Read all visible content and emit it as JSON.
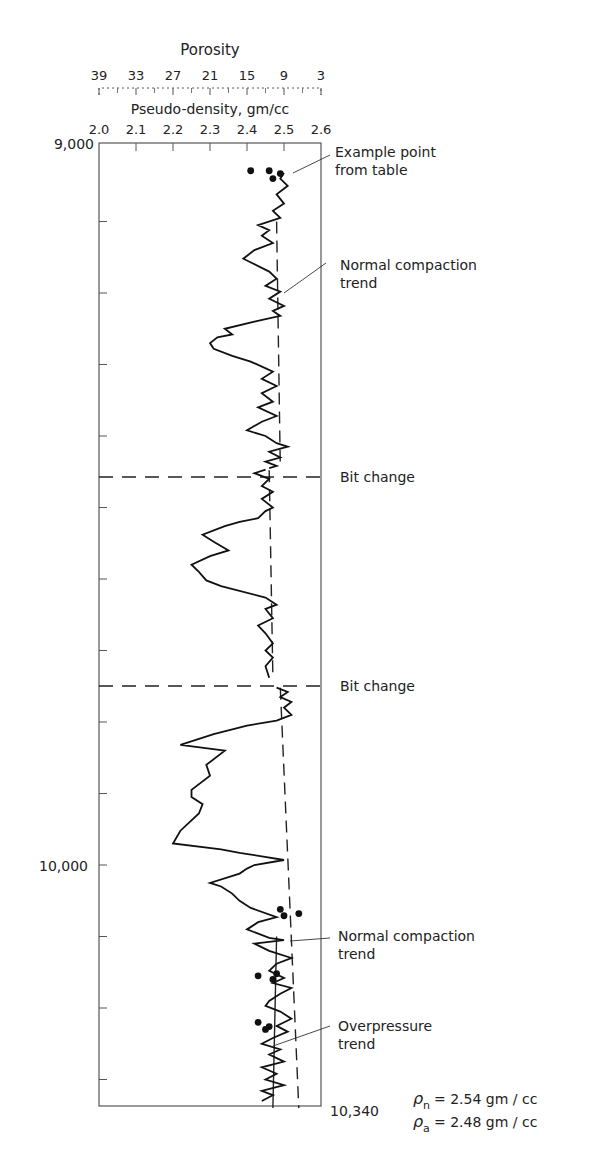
{
  "chart_data": {
    "type": "line",
    "title": "",
    "top_axis_porosity": {
      "label": "Porosity",
      "ticks": [
        "39",
        "33",
        "27",
        "21",
        "15",
        "9",
        "3"
      ]
    },
    "xlabel": "Pseudo-density, gm/cc",
    "x_ticks": [
      "2.0",
      "2.1",
      "2.2",
      "2.3",
      "2.4",
      "2.5",
      "2.6"
    ],
    "xlim": [
      2.0,
      2.6
    ],
    "ylabel": "Depth, ft",
    "y_tick_labels": [
      {
        "depth": 9000,
        "label": "9,000"
      },
      {
        "depth": 10000,
        "label": "10,000"
      },
      {
        "depth": 10340,
        "label": "10,340"
      }
    ],
    "ylim": [
      9000,
      10340
    ],
    "bit_changes_depth": [
      9445,
      9740
    ],
    "series": [
      {
        "name": "Pseudo-density log",
        "points": [
          [
            2.5,
            9032
          ],
          [
            2.49,
            9040
          ],
          [
            2.51,
            9050
          ],
          [
            2.48,
            9062
          ],
          [
            2.5,
            9075
          ],
          [
            2.47,
            9085
          ],
          [
            2.49,
            9095
          ],
          [
            2.43,
            9105
          ],
          [
            2.46,
            9112
          ],
          [
            2.44,
            9120
          ],
          [
            2.47,
            9130
          ],
          [
            2.42,
            9140
          ],
          [
            2.39,
            9152
          ],
          [
            2.46,
            9170
          ],
          [
            2.48,
            9180
          ],
          [
            2.45,
            9190
          ],
          [
            2.49,
            9198
          ],
          [
            2.46,
            9208
          ],
          [
            2.5,
            9218
          ],
          [
            2.47,
            9225
          ],
          [
            2.49,
            9232
          ],
          [
            2.42,
            9240
          ],
          [
            2.34,
            9250
          ],
          [
            2.36,
            9258
          ],
          [
            2.32,
            9262
          ],
          [
            2.3,
            9270
          ],
          [
            2.31,
            9278
          ],
          [
            2.36,
            9288
          ],
          [
            2.41,
            9296
          ],
          [
            2.47,
            9310
          ],
          [
            2.44,
            9320
          ],
          [
            2.48,
            9330
          ],
          [
            2.44,
            9340
          ],
          [
            2.47,
            9352
          ],
          [
            2.43,
            9360
          ],
          [
            2.48,
            9372
          ],
          [
            2.44,
            9380
          ],
          [
            2.4,
            9392
          ],
          [
            2.45,
            9400
          ],
          [
            2.48,
            9410
          ],
          [
            2.51,
            9415
          ],
          [
            2.46,
            9422
          ],
          [
            2.49,
            9430
          ],
          [
            2.45,
            9436
          ],
          [
            2.48,
            9442
          ],
          [
            2.46,
            9445
          ]
        ]
      },
      {
        "name": "Pseudo-density log (interval 2)",
        "points": [
          [
            2.45,
            9447
          ],
          [
            2.42,
            9452
          ],
          [
            2.46,
            9460
          ],
          [
            2.44,
            9470
          ],
          [
            2.47,
            9478
          ],
          [
            2.44,
            9488
          ],
          [
            2.47,
            9500
          ],
          [
            2.45,
            9505
          ],
          [
            2.43,
            9515
          ],
          [
            2.38,
            9520
          ],
          [
            2.34,
            9526
          ],
          [
            2.28,
            9538
          ],
          [
            2.31,
            9548
          ],
          [
            2.35,
            9560
          ],
          [
            2.3,
            9568
          ],
          [
            2.25,
            9580
          ],
          [
            2.27,
            9590
          ],
          [
            2.29,
            9602
          ],
          [
            2.33,
            9610
          ],
          [
            2.45,
            9626
          ],
          [
            2.48,
            9636
          ],
          [
            2.45,
            9642
          ],
          [
            2.47,
            9655
          ],
          [
            2.43,
            9665
          ],
          [
            2.45,
            9676
          ],
          [
            2.47,
            9690
          ],
          [
            2.45,
            9700
          ],
          [
            2.47,
            9710
          ],
          [
            2.45,
            9722
          ],
          [
            2.46,
            9738
          ]
        ]
      },
      {
        "name": "Pseudo-density log (interval 3)",
        "points": [
          [
            2.48,
            9752
          ],
          [
            2.51,
            9758
          ],
          [
            2.49,
            9765
          ],
          [
            2.52,
            9772
          ],
          [
            2.5,
            9780
          ],
          [
            2.52,
            9790
          ],
          [
            2.48,
            9798
          ],
          [
            2.4,
            9805
          ],
          [
            2.31,
            9817
          ],
          [
            2.22,
            9832
          ],
          [
            2.34,
            9840
          ],
          [
            2.29,
            9860
          ],
          [
            2.3,
            9875
          ],
          [
            2.25,
            9895
          ],
          [
            2.25,
            9905
          ],
          [
            2.28,
            9915
          ],
          [
            2.27,
            9928
          ],
          [
            2.22,
            9952
          ],
          [
            2.2,
            9970
          ],
          [
            2.33,
            9978
          ],
          [
            2.38,
            9983
          ],
          [
            2.44,
            9988
          ],
          [
            2.5,
            9993
          ],
          [
            2.42,
            10000
          ],
          [
            2.4,
            10005
          ],
          [
            2.38,
            10012
          ],
          [
            2.3,
            10025
          ],
          [
            2.33,
            10030
          ],
          [
            2.36,
            10040
          ],
          [
            2.38,
            10050
          ],
          [
            2.41,
            10060
          ],
          [
            2.48,
            10073
          ],
          [
            2.43,
            10080
          ],
          [
            2.4,
            10090
          ],
          [
            2.46,
            10102
          ],
          [
            2.5,
            10105
          ],
          [
            2.42,
            10110
          ],
          [
            2.46,
            10120
          ],
          [
            2.52,
            10130
          ],
          [
            2.48,
            10138
          ],
          [
            2.46,
            10148
          ],
          [
            2.5,
            10158
          ],
          [
            2.47,
            10165
          ],
          [
            2.52,
            10172
          ],
          [
            2.49,
            10180
          ],
          [
            2.46,
            10190
          ],
          [
            2.45,
            10197
          ],
          [
            2.49,
            10205
          ],
          [
            2.52,
            10215
          ],
          [
            2.48,
            10225
          ],
          [
            2.51,
            10233
          ],
          [
            2.47,
            10242
          ],
          [
            2.44,
            10250
          ],
          [
            2.49,
            10258
          ],
          [
            2.46,
            10265
          ],
          [
            2.5,
            10275
          ],
          [
            2.44,
            10283
          ],
          [
            2.48,
            10292
          ],
          [
            2.45,
            10300
          ],
          [
            2.5,
            10308
          ],
          [
            2.44,
            10316
          ],
          [
            2.47,
            10322
          ],
          [
            2.44,
            10330
          ]
        ]
      }
    ],
    "trend_lines": [
      {
        "name": "Normal compaction trend (upper)",
        "style": "dashed",
        "from": [
          2.48,
          9100
        ],
        "to": [
          2.49,
          9445
        ]
      },
      {
        "name": "Normal compaction trend (middle)",
        "style": "dashed",
        "from": [
          2.46,
          9448
        ],
        "to": [
          2.47,
          9738
        ]
      },
      {
        "name": "Normal compaction trend (lower)",
        "style": "dashed",
        "from": [
          2.49,
          9752
        ],
        "to": [
          2.54,
          10340
        ]
      },
      {
        "name": "Overpressure trend",
        "style": "solid",
        "from": [
          2.48,
          10100
        ],
        "to": [
          2.47,
          10340
        ]
      }
    ],
    "example_points": [
      [
        2.41,
        9029
      ],
      [
        2.46,
        9029
      ],
      [
        2.49,
        9033
      ],
      [
        2.47,
        9040
      ],
      [
        2.49,
        10062
      ],
      [
        2.54,
        10068
      ],
      [
        2.5,
        10071
      ],
      [
        2.43,
        10155
      ],
      [
        2.47,
        10160
      ],
      [
        2.48,
        10152
      ],
      [
        2.43,
        10220
      ],
      [
        2.45,
        10230
      ],
      [
        2.46,
        10226
      ]
    ],
    "annotations": [
      {
        "text": "Example point from table",
        "lines": [
          "Example point",
          "from table"
        ]
      },
      {
        "text": "Normal compaction trend",
        "lines": [
          "Normal compaction",
          "trend"
        ]
      },
      {
        "text": "Bit change"
      },
      {
        "text": "Bit change"
      },
      {
        "text": "Normal compaction trend",
        "lines": [
          "Normal compaction",
          "trend"
        ]
      },
      {
        "text": "Overpressure trend",
        "lines": [
          "Overpressure",
          "trend"
        ]
      }
    ],
    "legend_values": {
      "rho_n": "2.54 gm/cc",
      "rho_a": "2.48 gm/cc"
    },
    "grid": false
  },
  "labels": {
    "porosity_title": "Porosity",
    "density_title": "Pseudo-density, gm/cc",
    "depth_top": "9,000",
    "depth_mid": "10,000",
    "depth_bottom": "10,340",
    "example_1": "Example point",
    "example_2": "from table",
    "nct_1a": "Normal compaction",
    "nct_1b": "trend",
    "bit_change_1": "Bit change",
    "bit_change_2": "Bit change",
    "nct_2a": "Normal compaction",
    "nct_2b": "trend",
    "op_a": "Overpressure",
    "op_b": "trend",
    "rho_n_sym": "ρ",
    "rho_n_sub": "n",
    "rho_n_val": "= 2.54 gm / cc",
    "rho_a_sym": "ρ",
    "rho_a_sub": "a",
    "rho_a_val": "= 2.48 gm / cc"
  }
}
